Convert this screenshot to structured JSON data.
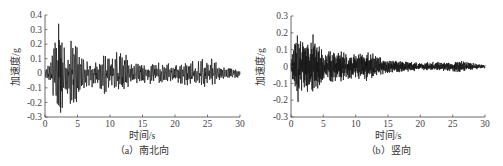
{
  "chart_data": [
    {
      "type": "line",
      "title": "(a) 南北向",
      "xlabel": "时间/s",
      "ylabel": "加速度/g",
      "xlim": [
        0,
        30
      ],
      "ylim": [
        -0.3,
        0.4
      ],
      "xticks": [
        "0",
        "5",
        "10",
        "15",
        "20",
        "25",
        "30"
      ],
      "yticks": [
        "0.4",
        "0.3",
        "0.2",
        "0.1",
        "0",
        "-0.1",
        "-0.2",
        "-0.3"
      ],
      "grid": false,
      "peaks": {
        "max": 0.34,
        "max_t": 2.1,
        "min": -0.27,
        "min_t": 2.4
      },
      "envelope": [
        [
          0,
          0.02
        ],
        [
          1,
          0.12
        ],
        [
          2,
          0.32
        ],
        [
          3,
          0.22
        ],
        [
          4.5,
          0.25
        ],
        [
          5.5,
          0.14
        ],
        [
          8,
          0.08
        ],
        [
          9,
          0.17
        ],
        [
          10,
          0.1
        ],
        [
          12,
          0.2
        ],
        [
          13,
          0.08
        ],
        [
          20,
          0.07
        ],
        [
          24,
          0.1
        ],
        [
          26,
          0.12
        ],
        [
          27,
          0.05
        ],
        [
          30,
          0.03
        ]
      ],
      "series": [
        {
          "name": "南北向",
          "seed": 7
        }
      ]
    },
    {
      "type": "line",
      "title": "(b) 竖向",
      "xlabel": "时间/s",
      "ylabel": "加速度/g",
      "xlim": [
        0,
        30
      ],
      "ylim": [
        -0.3,
        0.3
      ],
      "xticks": [
        "0",
        "5",
        "10",
        "15",
        "20",
        "25",
        "30"
      ],
      "yticks": [
        "0.3",
        "0.2",
        "0.1",
        "0",
        "-0.1",
        "-0.2",
        "-0.3"
      ],
      "grid": false,
      "peaks": {
        "max": 0.19,
        "max_t": 3.4,
        "min": -0.21,
        "min_t": 1.1
      },
      "envelope": [
        [
          0,
          0.05
        ],
        [
          0.5,
          0.13
        ],
        [
          1,
          0.19
        ],
        [
          2,
          0.14
        ],
        [
          3.4,
          0.19
        ],
        [
          5,
          0.09
        ],
        [
          7,
          0.1
        ],
        [
          10,
          0.07
        ],
        [
          12,
          0.09
        ],
        [
          15,
          0.04
        ],
        [
          20,
          0.025
        ],
        [
          26,
          0.035
        ],
        [
          30,
          0.01
        ]
      ],
      "series": [
        {
          "name": "竖向",
          "seed": 13
        }
      ]
    }
  ],
  "panels": [
    {
      "caption": "（a）南北向",
      "xlabel": "时间/s",
      "ylabel": "加速度/g"
    },
    {
      "caption": "（b）竖向",
      "xlabel": "时间/s",
      "ylabel": "加速度/g"
    }
  ]
}
